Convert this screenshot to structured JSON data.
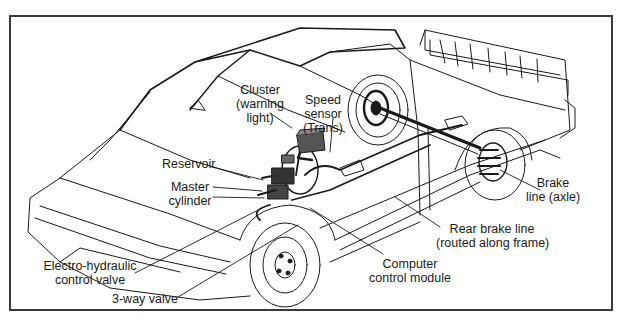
{
  "figure": {
    "labels": [
      {
        "id": "cluster",
        "line1": "Cluster",
        "line2": "(warning",
        "line3": "light)"
      },
      {
        "id": "speed-sensor",
        "line1": "Speed",
        "line2": "sensor",
        "line3": "(Trans)"
      },
      {
        "id": "reservoir",
        "line1": "Reservoir"
      },
      {
        "id": "master-cylinder",
        "line1": "Master",
        "line2": "cylinder"
      },
      {
        "id": "electro-hydraulic-valve",
        "line1": "Electro-hydraulic",
        "line2": "control valve"
      },
      {
        "id": "three-way-valve",
        "line1": "3-way valve"
      },
      {
        "id": "computer-module",
        "line1": "Computer",
        "line2": "control module"
      },
      {
        "id": "rear-brake-line",
        "line1": "Rear brake line",
        "line2": "(routed along frame)"
      },
      {
        "id": "brake-line-axle",
        "line1": "Brake",
        "line2": "line (axle)"
      }
    ]
  },
  "colors": {
    "line": "#1a1a1a",
    "frame": "#3a3a3a",
    "module": "#555555",
    "background": "#ffffff"
  }
}
